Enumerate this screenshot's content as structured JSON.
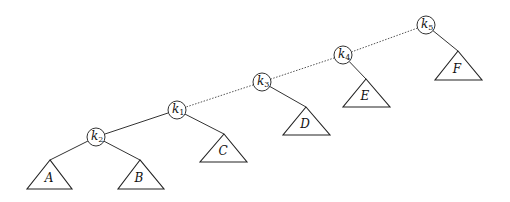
{
  "diagram": {
    "type": "binary-search-tree",
    "nodes": [
      {
        "id": "k5",
        "base": "k",
        "sub": "5",
        "x": 426,
        "y": 25
      },
      {
        "id": "k4",
        "base": "k",
        "sub": "4",
        "x": 343,
        "y": 55
      },
      {
        "id": "k3",
        "base": "k",
        "sub": "3",
        "x": 262,
        "y": 82
      },
      {
        "id": "k1",
        "base": "k",
        "sub": "1",
        "x": 177,
        "y": 110
      },
      {
        "id": "k2",
        "base": "k",
        "sub": "2",
        "x": 96,
        "y": 137
      }
    ],
    "subtrees": [
      {
        "id": "A",
        "label": "A",
        "parent": "k2",
        "apex": [
          50,
          160
        ],
        "base_y": 189,
        "left": 27,
        "right": 72
      },
      {
        "id": "B",
        "label": "B",
        "parent": "k2",
        "apex": [
          140,
          160
        ],
        "base_y": 189,
        "left": 118,
        "right": 164
      },
      {
        "id": "C",
        "label": "C",
        "parent": "k1",
        "apex": [
          224,
          134
        ],
        "base_y": 162,
        "left": 200,
        "right": 247
      },
      {
        "id": "D",
        "label": "D",
        "parent": "k3",
        "apex": [
          306,
          107
        ],
        "base_y": 135,
        "left": 283,
        "right": 330
      },
      {
        "id": "E",
        "label": "E",
        "parent": "k4",
        "apex": [
          366,
          79
        ],
        "base_y": 107,
        "left": 343,
        "right": 390
      },
      {
        "id": "F",
        "label": "F",
        "parent": "k5",
        "apex": [
          458,
          51
        ],
        "base_y": 80,
        "left": 435,
        "right": 482
      }
    ],
    "edges": [
      {
        "from": "k5",
        "to": "k4",
        "style": "dotted"
      },
      {
        "from": "k4",
        "to": "k3",
        "style": "dotted"
      },
      {
        "from": "k3",
        "to": "k1",
        "style": "dotted"
      },
      {
        "from": "k1",
        "to": "k2",
        "style": "solid"
      }
    ],
    "node_radius": 9
  }
}
